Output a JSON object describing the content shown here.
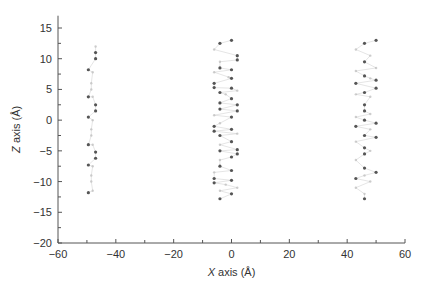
{
  "chart_data": {
    "type": "scatter",
    "title": "",
    "xlabel": "X axis (Å)",
    "xlabel_italic": "X",
    "xlabel_rest": " axis (Å)",
    "ylabel": "Z axis (Å)",
    "ylabel_italic": "Z",
    "ylabel_rest": " axis (Å)",
    "xlim": [
      -60,
      60
    ],
    "ylim": [
      -20,
      17
    ],
    "x_ticks": [
      -60,
      -40,
      -20,
      0,
      20,
      40,
      60
    ],
    "x_tick_labels": [
      "−60",
      "−40",
      "−20",
      "0",
      "20",
      "40",
      "60"
    ],
    "y_ticks": [
      -20,
      -15,
      -10,
      -5,
      0,
      5,
      10,
      15
    ],
    "y_tick_labels": [
      "−20",
      "−15",
      "−10",
      "−5",
      "0",
      "5",
      "10",
      "15"
    ],
    "x_minor_step": 10,
    "y_minor_step": 2.5,
    "grid": false,
    "legend": null,
    "colors": {
      "axis": "#555555",
      "dark_point": "#444444",
      "light_point": "#bbbbbb",
      "bond": "#d0d0d0"
    },
    "series": [
      {
        "name": "cluster-left",
        "center_x": -48,
        "points": [
          {
            "x": -47,
            "y": 12,
            "s": "l"
          },
          {
            "x": -47,
            "y": 11,
            "s": "d"
          },
          {
            "x": -47,
            "y": 10,
            "s": "d"
          },
          {
            "x": -49.5,
            "y": 8.2,
            "s": "d"
          },
          {
            "x": -48,
            "y": 7.8,
            "s": "l"
          },
          {
            "x": -48.5,
            "y": 6,
            "s": "l"
          },
          {
            "x": -48.5,
            "y": 5,
            "s": "l"
          },
          {
            "x": -49.5,
            "y": 3.8,
            "s": "d"
          },
          {
            "x": -48,
            "y": 3.8,
            "s": "l"
          },
          {
            "x": -47,
            "y": 2.5,
            "s": "d"
          },
          {
            "x": -47,
            "y": 1.5,
            "s": "d"
          },
          {
            "x": -49.5,
            "y": 0.5,
            "s": "d"
          },
          {
            "x": -48,
            "y": 0,
            "s": "l"
          },
          {
            "x": -48.5,
            "y": -1.5,
            "s": "l"
          },
          {
            "x": -48.5,
            "y": -2.5,
            "s": "l"
          },
          {
            "x": -49.5,
            "y": -4,
            "s": "d"
          },
          {
            "x": -48,
            "y": -4,
            "s": "l"
          },
          {
            "x": -47,
            "y": -5.2,
            "s": "d"
          },
          {
            "x": -47,
            "y": -6.2,
            "s": "d"
          },
          {
            "x": -49.5,
            "y": -7.3,
            "s": "d"
          },
          {
            "x": -48,
            "y": -7.5,
            "s": "l"
          },
          {
            "x": -48.5,
            "y": -9,
            "s": "l"
          },
          {
            "x": -48.5,
            "y": -10,
            "s": "l"
          },
          {
            "x": -49.5,
            "y": -11.8,
            "s": "d"
          },
          {
            "x": -48,
            "y": -11.5,
            "s": "l"
          }
        ]
      },
      {
        "name": "cluster-center",
        "center_x": -2,
        "points": [
          {
            "x": -4,
            "y": 12.5,
            "s": "d"
          },
          {
            "x": 0,
            "y": 13,
            "s": "d"
          },
          {
            "x": -6,
            "y": 11.5,
            "s": "l"
          },
          {
            "x": 2,
            "y": 10.5,
            "s": "d"
          },
          {
            "x": 2,
            "y": 9.8,
            "s": "d"
          },
          {
            "x": -4,
            "y": 9.5,
            "s": "l"
          },
          {
            "x": -4,
            "y": 8.5,
            "s": "d"
          },
          {
            "x": 0,
            "y": 8.2,
            "s": "d"
          },
          {
            "x": -6,
            "y": 7.8,
            "s": "l"
          },
          {
            "x": -1,
            "y": 7,
            "s": "l"
          },
          {
            "x": 0,
            "y": 6.8,
            "s": "d"
          },
          {
            "x": -6,
            "y": 6,
            "s": "d"
          },
          {
            "x": -6,
            "y": 5.3,
            "s": "d"
          },
          {
            "x": 0,
            "y": 5.2,
            "s": "d"
          },
          {
            "x": 2,
            "y": 4.8,
            "s": "l"
          },
          {
            "x": -4,
            "y": 4.5,
            "s": "d"
          },
          {
            "x": -2,
            "y": 4.2,
            "s": "l"
          },
          {
            "x": 0,
            "y": 3.5,
            "s": "d"
          },
          {
            "x": -4,
            "y": 2.8,
            "s": "d"
          },
          {
            "x": 2,
            "y": 2.5,
            "s": "d"
          },
          {
            "x": -4,
            "y": 1.8,
            "s": "d"
          },
          {
            "x": 2,
            "y": 1.5,
            "s": "d"
          },
          {
            "x": -6,
            "y": 0.8,
            "s": "l"
          },
          {
            "x": 0,
            "y": 0.5,
            "s": "d"
          },
          {
            "x": -4,
            "y": -0.5,
            "s": "l"
          },
          {
            "x": -6,
            "y": -1,
            "s": "d"
          },
          {
            "x": -6,
            "y": -1.8,
            "s": "d"
          },
          {
            "x": 0,
            "y": -1.5,
            "s": "d"
          },
          {
            "x": -4,
            "y": -2.5,
            "s": "d"
          },
          {
            "x": 2,
            "y": -2.2,
            "s": "l"
          },
          {
            "x": 0,
            "y": -3.5,
            "s": "d"
          },
          {
            "x": -4,
            "y": -4,
            "s": "l"
          },
          {
            "x": -4,
            "y": -5,
            "s": "d"
          },
          {
            "x": 2,
            "y": -4.8,
            "s": "d"
          },
          {
            "x": 2,
            "y": -5.5,
            "s": "d"
          },
          {
            "x": 0,
            "y": -6,
            "s": "d"
          },
          {
            "x": -4,
            "y": -6.5,
            "s": "l"
          },
          {
            "x": -4,
            "y": -7.5,
            "s": "d"
          },
          {
            "x": 0,
            "y": -8.2,
            "s": "d"
          },
          {
            "x": -6,
            "y": -8.5,
            "s": "l"
          },
          {
            "x": -6,
            "y": -9.5,
            "s": "d"
          },
          {
            "x": -6,
            "y": -10.2,
            "s": "d"
          },
          {
            "x": 0,
            "y": -9.8,
            "s": "d"
          },
          {
            "x": -2,
            "y": -10.5,
            "s": "l"
          },
          {
            "x": 2,
            "y": -11,
            "s": "l"
          },
          {
            "x": -4,
            "y": -11.5,
            "s": "l"
          },
          {
            "x": 0,
            "y": -12,
            "s": "d"
          },
          {
            "x": -4,
            "y": -12.8,
            "s": "d"
          }
        ]
      },
      {
        "name": "cluster-right",
        "center_x": 46,
        "points": [
          {
            "x": 46,
            "y": 12.5,
            "s": "d"
          },
          {
            "x": 50,
            "y": 13,
            "s": "d"
          },
          {
            "x": 43,
            "y": 11.5,
            "s": "l"
          },
          {
            "x": 48,
            "y": 10.5,
            "s": "l"
          },
          {
            "x": 46,
            "y": 9.5,
            "s": "d"
          },
          {
            "x": 50,
            "y": 8.5,
            "s": "l"
          },
          {
            "x": 43,
            "y": 8,
            "s": "l"
          },
          {
            "x": 46,
            "y": 7.2,
            "s": "d"
          },
          {
            "x": 48,
            "y": 6.8,
            "s": "l"
          },
          {
            "x": 50,
            "y": 6.5,
            "s": "d"
          },
          {
            "x": 43,
            "y": 6,
            "s": "d"
          },
          {
            "x": 50,
            "y": 5.2,
            "s": "d"
          },
          {
            "x": 46,
            "y": 4.5,
            "s": "d"
          },
          {
            "x": 43,
            "y": 4.2,
            "s": "l"
          },
          {
            "x": 48,
            "y": 3.8,
            "s": "l"
          },
          {
            "x": 46,
            "y": 2.5,
            "s": "d"
          },
          {
            "x": 46,
            "y": 1.5,
            "s": "d"
          },
          {
            "x": 48,
            "y": 1,
            "s": "l"
          },
          {
            "x": 43,
            "y": 0.5,
            "s": "l"
          },
          {
            "x": 46,
            "y": 0,
            "s": "d"
          },
          {
            "x": 50,
            "y": -0.5,
            "s": "d"
          },
          {
            "x": 43,
            "y": -1,
            "s": "d"
          },
          {
            "x": 48,
            "y": -1.5,
            "s": "l"
          },
          {
            "x": 46,
            "y": -2.5,
            "s": "d"
          },
          {
            "x": 50,
            "y": -2.8,
            "s": "d"
          },
          {
            "x": 43,
            "y": -3.5,
            "s": "l"
          },
          {
            "x": 46,
            "y": -4.5,
            "s": "d"
          },
          {
            "x": 48,
            "y": -5,
            "s": "l"
          },
          {
            "x": 46,
            "y": -5.5,
            "s": "d"
          },
          {
            "x": 43,
            "y": -6.5,
            "s": "l"
          },
          {
            "x": 46,
            "y": -7.8,
            "s": "d"
          },
          {
            "x": 50,
            "y": -8.5,
            "s": "d"
          },
          {
            "x": 43,
            "y": -9.5,
            "s": "d"
          },
          {
            "x": 46,
            "y": -9,
            "s": "l"
          },
          {
            "x": 48,
            "y": -10,
            "s": "l"
          },
          {
            "x": 43,
            "y": -11,
            "s": "l"
          },
          {
            "x": 46,
            "y": -12,
            "s": "l"
          },
          {
            "x": 46,
            "y": -12.8,
            "s": "d"
          }
        ]
      }
    ]
  }
}
